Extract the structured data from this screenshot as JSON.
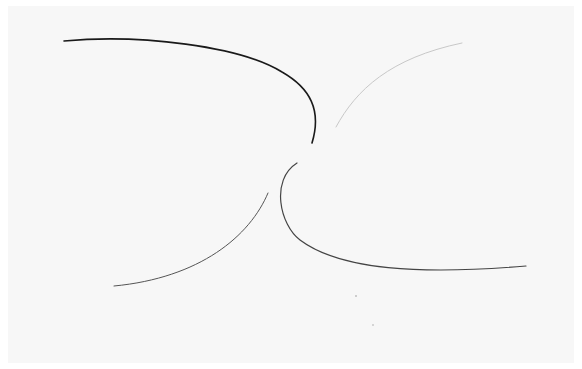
{
  "artwork": {
    "description": "Four curved line strokes on paper converging toward a center point",
    "background_color": "#f7f7f7",
    "strokes": [
      {
        "name": "upper-left-arc",
        "color": "#1a1a1a",
        "width": 1.6
      },
      {
        "name": "upper-right-arc",
        "color": "#c8c8c8",
        "width": 1.0
      },
      {
        "name": "lower-left-arc",
        "color": "#555555",
        "width": 1.0
      },
      {
        "name": "lower-right-arc",
        "color": "#444444",
        "width": 1.2
      }
    ]
  }
}
